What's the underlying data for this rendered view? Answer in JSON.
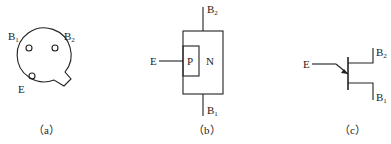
{
  "figure_a": {
    "caption": "（a）",
    "labels": {
      "b1": "B",
      "b1_sub": "1",
      "b2": "B",
      "b2_sub": "2",
      "e": "E"
    }
  },
  "figure_b": {
    "caption": "（b）",
    "labels": {
      "b2": "B",
      "b2_sub": "2",
      "b1": "B",
      "b1_sub": "1",
      "e": "E",
      "p": "P",
      "n": "N"
    }
  },
  "figure_c": {
    "caption": "（c）",
    "labels": {
      "b2": "B",
      "b2_sub": "2",
      "b1": "B",
      "b1_sub": "1",
      "e": "E"
    }
  }
}
